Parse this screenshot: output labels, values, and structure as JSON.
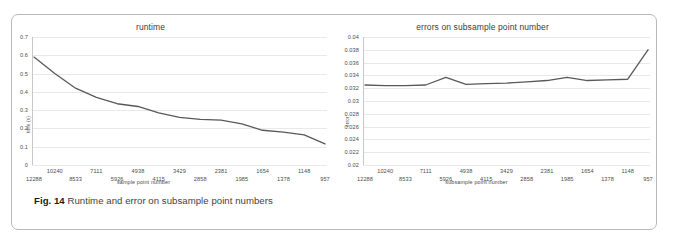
{
  "figure": {
    "caption_prefix": "Fig. 14",
    "caption_text": "Runtime and error on subsample point numbers",
    "border_color": "#b9b9b9",
    "line_color": "#595959",
    "grid_color": "#e9e9e9"
  },
  "chart_data": [
    {
      "type": "line",
      "title": "runtime",
      "xlabel": "sample point number",
      "ylabel": "time (s)",
      "grid": true,
      "legend": "none",
      "ylim": [
        0,
        0.7
      ],
      "yticks": [
        "0",
        "0.1",
        "0.2",
        "0.3",
        "0.4",
        "0.5",
        "0.6",
        "0.7"
      ],
      "ytick_values": [
        0,
        0.1,
        0.2,
        0.3,
        0.4,
        0.5,
        0.6,
        0.7
      ],
      "categories": [
        "12288",
        "10240",
        "8533",
        "7111",
        "5926",
        "4938",
        "4115",
        "3429",
        "2858",
        "2381",
        "1985",
        "1654",
        "1378",
        "1148",
        "957"
      ],
      "values": [
        0.59,
        0.5,
        0.42,
        0.37,
        0.335,
        0.32,
        0.285,
        0.26,
        0.25,
        0.245,
        0.225,
        0.19,
        0.18,
        0.17,
        0.155,
        0.15,
        0.13,
        0.115
      ],
      "x_positions": [
        0,
        1,
        2,
        3,
        4,
        4.7,
        5.6,
        6.3,
        7.1,
        7.8,
        8.6,
        9.5,
        10.2,
        11.0,
        11.7,
        12.5,
        13.4,
        14
      ],
      "series": [
        {
          "name": "runtime",
          "points": [
            {
              "x": "12288",
              "y": 0.59
            },
            {
              "x": "10240",
              "y": 0.5
            },
            {
              "x": "8533",
              "y": 0.42
            },
            {
              "x": "7111",
              "y": 0.37
            },
            {
              "x": "5926",
              "y": 0.335
            },
            {
              "x": "4938",
              "y": 0.32
            },
            {
              "x": "4115",
              "y": 0.285
            },
            {
              "x": "3429",
              "y": 0.26
            },
            {
              "x": "2858",
              "y": 0.25
            },
            {
              "x": "2381",
              "y": 0.245
            },
            {
              "x": "1985",
              "y": 0.225
            },
            {
              "x": "1654",
              "y": 0.19
            },
            {
              "x": "1378",
              "y": 0.18
            },
            {
              "x": "1148",
              "y": 0.165
            },
            {
              "x": "957",
              "y": 0.115
            }
          ]
        }
      ]
    },
    {
      "type": "line",
      "title": "errors on subsample point number",
      "xlabel": "subsample point number",
      "ylabel": "error",
      "grid": true,
      "legend": "none",
      "ylim": [
        0.02,
        0.04
      ],
      "yticks": [
        "0.02",
        "0.022",
        "0.024",
        "0.026",
        "0.028",
        "0.03",
        "0.032",
        "0.034",
        "0.036",
        "0.038",
        "0.04"
      ],
      "ytick_values": [
        0.02,
        0.022,
        0.024,
        0.026,
        0.028,
        0.03,
        0.032,
        0.034,
        0.036,
        0.038,
        0.04
      ],
      "categories": [
        "12288",
        "10240",
        "8533",
        "7111",
        "5926",
        "4938",
        "4115",
        "3429",
        "2858",
        "2381",
        "1985",
        "1654",
        "1378",
        "1148",
        "957"
      ],
      "series": [
        {
          "name": "error",
          "points": [
            {
              "x": "12288",
              "y": 0.0325
            },
            {
              "x": "10240",
              "y": 0.0324
            },
            {
              "x": "8533",
              "y": 0.0324
            },
            {
              "x": "7111",
              "y": 0.0325
            },
            {
              "x": "5926",
              "y": 0.0337
            },
            {
              "x": "4938",
              "y": 0.0326
            },
            {
              "x": "4115",
              "y": 0.0327
            },
            {
              "x": "3429",
              "y": 0.0328
            },
            {
              "x": "2858",
              "y": 0.033
            },
            {
              "x": "2381",
              "y": 0.0332
            },
            {
              "x": "1985",
              "y": 0.0337
            },
            {
              "x": "1654",
              "y": 0.0332
            },
            {
              "x": "1378",
              "y": 0.0333
            },
            {
              "x": "1148",
              "y": 0.0334
            },
            {
              "x": "957",
              "y": 0.038
            }
          ]
        }
      ]
    }
  ]
}
